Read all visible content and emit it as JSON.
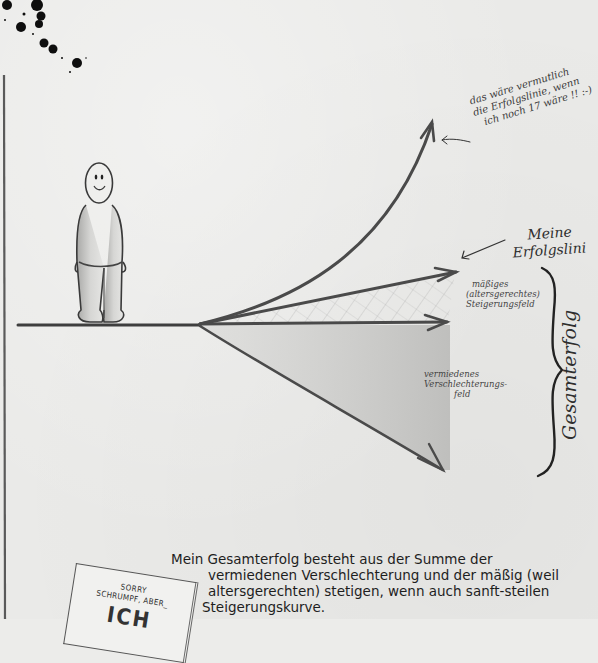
{
  "diagram": {
    "figure": {
      "label": "smiling stick figure standing on the baseline"
    },
    "annotations": {
      "hypothetical_line": [
        "das wäre vermutlich",
        "die Erfolgslinie, wenn",
        "ich noch 17 wäre !! :-)"
      ],
      "my_line": [
        "Meine",
        "Erfolgslini"
      ],
      "moderate_field": [
        "mäßiges",
        "(altersgerechtes)",
        "Steigerungsfeld"
      ],
      "avoided_field": [
        "vermiedenes",
        "Verschlechterungs-",
        "feld"
      ],
      "total": "Gesamterfolg"
    },
    "arrows": [
      {
        "name": "steep-curve",
        "meaning": "Erfolgslinie wenn 17"
      },
      {
        "name": "moderate-rise",
        "meaning": "Meine Erfolgslinie"
      },
      {
        "name": "horizontal",
        "meaning": "Status quo"
      },
      {
        "name": "decline",
        "meaning": "vermiedene Verschlechterung"
      }
    ],
    "colors": {
      "paper": "#eaeae8",
      "pencil": "#4a4a4a",
      "shade": "#c8c8c6",
      "ink": "#111111"
    }
  },
  "caption": {
    "lines": [
      "Mein Gesamterfolg besteht aus der Summe der",
      "vermiedenen Verschlechterung und der mäßig (weil",
      "altersgerechten) stetigen, wenn auch sanft-steilen",
      "Steigerungskurve."
    ]
  },
  "book": {
    "line1": "SORRY",
    "line2": "SCHRUMPF, ABER_",
    "line3": "ICH"
  }
}
